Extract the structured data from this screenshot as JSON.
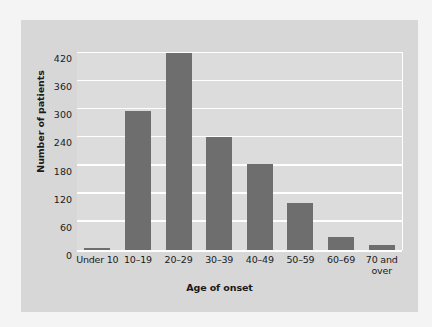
{
  "chart_data": {
    "type": "bar",
    "title": "",
    "xlabel": "Age of onset",
    "ylabel": "Number of patients",
    "categories": [
      "Under 10",
      "10–19",
      "20–29",
      "30–39",
      "40–49",
      "50–59",
      "60–69",
      "70 and over"
    ],
    "values": [
      5,
      296,
      419,
      242,
      184,
      100,
      27,
      11
    ],
    "ylim": [
      0,
      420
    ],
    "yticks": [
      0,
      60,
      120,
      180,
      240,
      300,
      360,
      420
    ],
    "ytick_labels": [
      "0",
      "60",
      "120",
      "180",
      "240",
      "300",
      "360",
      "420"
    ],
    "grid": "horizontal",
    "legend": "none",
    "bar_color": "#6e6e6e",
    "plot_background": "#dcdcdc",
    "card_background": "#d7d7d7",
    "gridline_color": "#ffffff"
  }
}
